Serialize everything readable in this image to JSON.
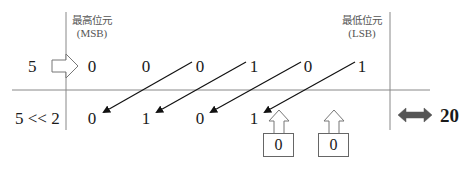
{
  "diagram": {
    "title_msb": "最高位元",
    "msb_abbr": "(MSB)",
    "title_lsb": "最低位元",
    "lsb_abbr": "(LSB)",
    "input_label": "5",
    "operation_label": "5 << 2",
    "input_bits": [
      "0",
      "0",
      "0",
      "1",
      "0",
      "1"
    ],
    "output_bits": [
      "0",
      "1",
      "0",
      "1"
    ],
    "fill_bits": [
      "0",
      "0"
    ],
    "result_value": "20",
    "shift_amount": 2,
    "colors": {
      "lines": "#888888",
      "arrows": "#111111",
      "double_arrow": "#555555",
      "text": "#1a1a1a"
    }
  }
}
